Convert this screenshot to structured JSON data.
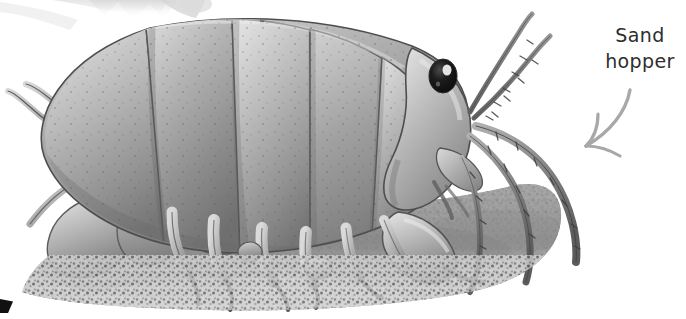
{
  "page": {
    "width": 686,
    "height": 319,
    "background_color": "#ffffff",
    "kind": "natural-history-illustration"
  },
  "annotation": {
    "label_line1": "Sand",
    "label_line2": "hopper",
    "label_color": "#2e2e2e",
    "arrow": {
      "name": "curved-arrow-pointing-down-left",
      "color": "#a8a8a8",
      "direction": "down-left"
    }
  },
  "illustration": {
    "subject": "sand hopper amphipod",
    "style": "grayscale pencil and wash drawing",
    "palette": {
      "body_light": "#cfcfcf",
      "body_mid": "#9a9a9a",
      "body_dark": "#6d6d6d",
      "outline": "#4a4a4a",
      "eye": "#151515",
      "eye_highlight": "#f2f2f2",
      "sand_light": "#d8d8d8",
      "sand_mid": "#9e9e9e",
      "sand_dark": "#5e5e5e",
      "ghost_fragment": "#dedede"
    },
    "parts": [
      {
        "name": "segmented-abdomen",
        "label": "Segmented abdomen plates"
      },
      {
        "name": "thorax-segments",
        "label": "Thorax segments"
      },
      {
        "name": "head",
        "label": "Head"
      },
      {
        "name": "compound-eye",
        "label": "Compound eye"
      },
      {
        "name": "antennae",
        "label": "Long segmented antennae"
      },
      {
        "name": "walking-legs",
        "label": "Walking legs with claws"
      },
      {
        "name": "gnathopods",
        "label": "Gnathopods"
      },
      {
        "name": "uropods",
        "label": "Uropods with spines"
      },
      {
        "name": "sand-substrate",
        "label": "Granular sand substrate"
      }
    ]
  },
  "page_artifacts": {
    "top_left_fragment": "faint grey image fragment bleeding from adjacent page",
    "bottom_left_mark": "small black corner mark"
  }
}
